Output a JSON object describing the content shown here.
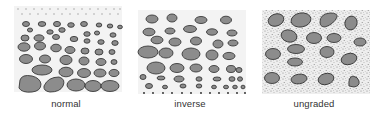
{
  "figure": {
    "panels": [
      {
        "id": "normal",
        "label": "normal"
      },
      {
        "id": "inverse",
        "label": "inverse"
      },
      {
        "id": "ungraded",
        "label": "ungraded"
      }
    ]
  },
  "colors": {
    "clast_fill": "#8c8c8c",
    "clast_stroke": "#3a3a3a",
    "box_background": "#f3f3f3",
    "matrix_dots": "#777777",
    "label_text": "#333333"
  }
}
